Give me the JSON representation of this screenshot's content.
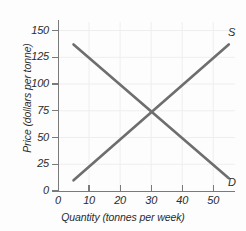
{
  "chart_data": {
    "type": "line",
    "title": "",
    "xlabel": "Quantity (tonnes per week)",
    "ylabel": "Price (dollars per tonne)",
    "xlim": [
      0,
      57
    ],
    "ylim": [
      0,
      158
    ],
    "xticks": [
      0,
      10,
      20,
      30,
      40,
      50
    ],
    "yticks": [
      0,
      25,
      50,
      75,
      100,
      125,
      150
    ],
    "xticklabels": [
      "0",
      "10",
      "20",
      "30",
      "40",
      "50"
    ],
    "yticklabels": [
      "0",
      "25",
      "50",
      "75",
      "100",
      "125",
      "150"
    ],
    "grid": true,
    "legend_position": "inline-end-of-line",
    "line_color": "#6e6e6e",
    "axis_color": "#7a7a7a",
    "background_color": "#fdfdfd",
    "equilibrium": {
      "quantity": 30,
      "price": 75
    },
    "series": [
      {
        "name": "S",
        "label": "S",
        "description": "Supply curve, upward sloping",
        "x": [
          5,
          55
        ],
        "values": [
          10,
          137
        ]
      },
      {
        "name": "D",
        "label": "D",
        "description": "Demand curve, downward sloping",
        "x": [
          5,
          55
        ],
        "values": [
          137,
          12
        ]
      }
    ]
  }
}
